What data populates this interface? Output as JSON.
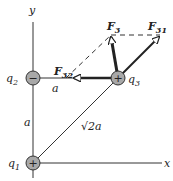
{
  "axes": {
    "x_label": "x",
    "y_label": "y"
  },
  "charges": [
    {
      "name": "q",
      "sub": "1",
      "sign": "+"
    },
    {
      "name": "q",
      "sub": "2",
      "sign": "−"
    },
    {
      "name": "q",
      "sub": "3",
      "sign": "+"
    }
  ],
  "distances": {
    "vertical": "a",
    "horizontal": "a",
    "diagonal": "√2a"
  },
  "forces": [
    {
      "name": "F",
      "sub": "3"
    },
    {
      "name": "F",
      "sub": "31"
    },
    {
      "name": "F",
      "sub": "32"
    }
  ],
  "colors": {
    "charge_fill": "#a8a8a8",
    "line": "#222222",
    "arrow_fill": "#ffffff"
  }
}
